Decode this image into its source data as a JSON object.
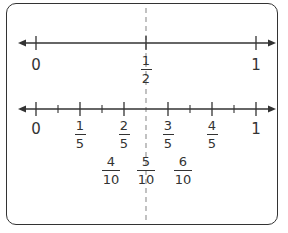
{
  "diagram": {
    "title": "",
    "line1": {
      "labels": [
        {
          "type": "whole",
          "text": "0",
          "x": 36
        },
        {
          "type": "frac",
          "num": "1",
          "den": "2",
          "x": 146
        },
        {
          "type": "whole",
          "text": "1",
          "x": 256
        }
      ]
    },
    "line2": {
      "labels": [
        {
          "type": "whole",
          "text": "0",
          "x": 36
        },
        {
          "type": "frac",
          "num": "1",
          "den": "5",
          "x": 80
        },
        {
          "type": "frac",
          "num": "2",
          "den": "5",
          "x": 124
        },
        {
          "type": "frac",
          "num": "3",
          "den": "5",
          "x": 168
        },
        {
          "type": "frac",
          "num": "4",
          "den": "5",
          "x": 212
        },
        {
          "type": "whole",
          "text": "1",
          "x": 256
        }
      ]
    },
    "tenths": [
      {
        "num": "4",
        "den": "10",
        "x": 124
      },
      {
        "num": "5",
        "den": "10",
        "x": 146
      },
      {
        "num": "6",
        "den": "10",
        "x": 168
      }
    ],
    "colors": {
      "line": "#333333",
      "dashed": "#999999"
    }
  }
}
